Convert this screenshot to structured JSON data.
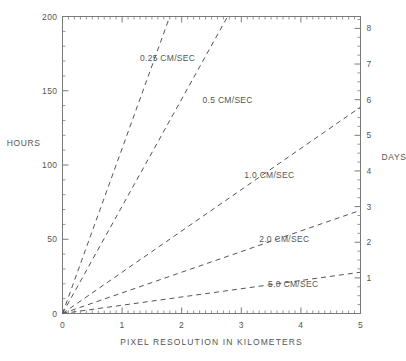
{
  "chart_data": {
    "type": "line",
    "title": "",
    "xlabel": "PIXEL RESOLUTION IN KILOMETERS",
    "ylabel": "HOURS",
    "y2label": "DAYS",
    "xlim": [
      0,
      5
    ],
    "ylim": [
      0,
      200
    ],
    "y2lim": [
      0,
      8.3333
    ],
    "grid": false,
    "legend_position": "inline-curve-labels",
    "x_ticks": [
      0,
      1,
      2,
      3,
      4,
      5
    ],
    "x_tick_labels": [
      "0",
      "1",
      "2",
      "3",
      "4",
      "5"
    ],
    "x_minor_interval": 0.1,
    "y_ticks": [
      0,
      50,
      100,
      150,
      200
    ],
    "y_tick_labels": [
      "0",
      "50",
      "100",
      "150",
      "200"
    ],
    "y_minor_interval": 10,
    "y2_ticks": [
      1,
      2,
      3,
      4,
      5,
      6,
      7,
      8
    ],
    "y2_tick_labels": [
      "1",
      "2",
      "3",
      "4",
      "5",
      "6",
      "7",
      "8"
    ],
    "y2_minor_interval": 0.25,
    "line_style": "dashed",
    "line_color": "#555555",
    "x": [
      0,
      5
    ],
    "series": [
      {
        "name": "0.25 CM/SEC",
        "label": "0.25 CM/SEC",
        "slope_hours_per_km": 111.1,
        "values": [
          0,
          555.5
        ],
        "clipped_at_top_x": 1.8
      },
      {
        "name": "0.5 CM/SEC",
        "label": "0.5 CM/SEC",
        "slope_hours_per_km": 72.2,
        "values": [
          0,
          361.0
        ],
        "clipped_at_top_x": 2.77
      },
      {
        "name": "1.0 CM/SEC",
        "label": "1.0 CM/SEC",
        "slope_hours_per_km": 27.8,
        "values": [
          0,
          139.0
        ],
        "clipped_at_top_x": null
      },
      {
        "name": "2.0 CM/SEC",
        "label": "2.0 CM/SEC",
        "slope_hours_per_km": 13.9,
        "values": [
          0,
          69.5
        ],
        "clipped_at_top_x": null
      },
      {
        "name": "5.0 CM/SEC",
        "label": "5.0 CM/SEC",
        "slope_hours_per_km": 5.56,
        "values": [
          0,
          27.8
        ],
        "clipped_at_top_x": null
      }
    ],
    "annotations": [
      {
        "text": "0.25 CM/SEC",
        "x": 1.3,
        "y": 172
      },
      {
        "text": "0.5 CM/SEC",
        "x": 2.35,
        "y": 144
      },
      {
        "text": "1.0 CM/SEC",
        "x": 3.05,
        "y": 93
      },
      {
        "text": "2.0 CM/SEC",
        "x": 3.3,
        "y": 50
      },
      {
        "text": "5.0 CM/SEC",
        "x": 3.45,
        "y": 20
      }
    ]
  },
  "axes": {
    "left_title": "HOURS",
    "right_title": "DAYS",
    "bottom_title": "PIXEL RESOLUTION IN KILOMETERS"
  },
  "style": {
    "background": "#ffffff",
    "ink": "#555555",
    "axis_color": "#7a7a7a"
  }
}
